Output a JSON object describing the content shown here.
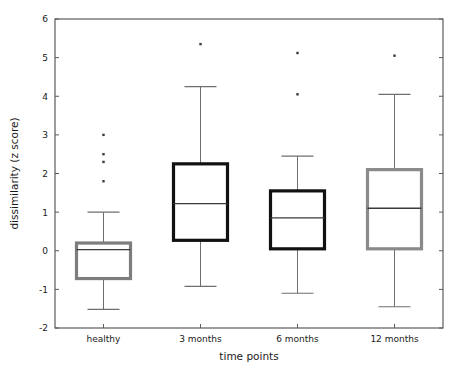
{
  "chart_data": {
    "type": "box",
    "title": "",
    "xlabel": "time points",
    "ylabel": "dissimilarity (z score)",
    "categories": [
      "healthy",
      "3 months",
      "6 months",
      "12 months"
    ],
    "ylim": [
      -2,
      6
    ],
    "xlim": [
      0.5,
      4.5
    ],
    "yticks": [
      -2,
      -1,
      0,
      1,
      2,
      3,
      4,
      5,
      6
    ],
    "ytick_labels": [
      "-2",
      "-1",
      "0",
      "1",
      "2",
      "3",
      "4",
      "5",
      "6"
    ],
    "grid": false,
    "legend": null,
    "box_colors": [
      "#7d7d7d",
      "#111111",
      "#111111",
      "#8a8a8a"
    ],
    "whisker_color": "#6e6e6e",
    "median_color": "#3a3a3a",
    "outlier_color": "#3a3a3a",
    "boxes": [
      {
        "label": "healthy",
        "color": "#7d7d7d",
        "whisker_low": -1.52,
        "q1": -0.72,
        "median": 0.03,
        "q3": 0.2,
        "whisker_high": 1.0,
        "outliers": [
          1.8,
          2.3,
          2.5,
          3.0
        ]
      },
      {
        "label": "3 months",
        "color": "#111111",
        "whisker_low": -0.92,
        "q1": 0.27,
        "median": 1.22,
        "q3": 2.25,
        "whisker_high": 4.25,
        "outliers": [
          5.35
        ]
      },
      {
        "label": "6 months",
        "color": "#111111",
        "whisker_low": -1.1,
        "q1": 0.05,
        "median": 0.85,
        "q3": 1.55,
        "whisker_high": 2.45,
        "outliers": [
          4.05,
          5.12
        ]
      },
      {
        "label": "12 months",
        "color": "#8a8a8a",
        "whisker_low": -1.45,
        "q1": 0.05,
        "median": 1.1,
        "q3": 2.1,
        "whisker_high": 4.05,
        "outliers": [
          5.05
        ]
      }
    ]
  },
  "axis": {
    "x_title": "time points",
    "y_title": "dissimilarity (z score)"
  }
}
